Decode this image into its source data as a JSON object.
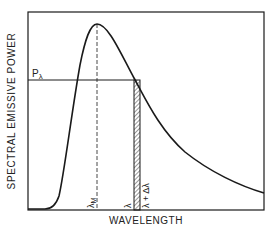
{
  "diagram": {
    "type": "planck-spectral-emissive-power",
    "y_axis_label": "SPECTRAL EMISSIVE POWER",
    "x_axis_label": "WAVELENGTH",
    "level_label": {
      "main": "P",
      "sub": "λ"
    },
    "peak_label": {
      "main": "λ",
      "sub": "M"
    },
    "band_start_label": "λ",
    "band_end_label": "λ + Δλ",
    "colors": {
      "line": "#1a1a1a",
      "background": "#ffffff"
    }
  }
}
